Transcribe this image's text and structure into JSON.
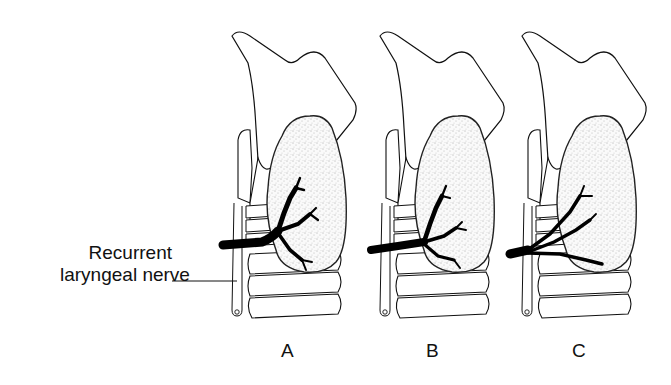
{
  "figure": {
    "annotation": {
      "line1": "Recurrent",
      "line2": "laryngeal nerve"
    },
    "panels": [
      {
        "label": "A",
        "variant": "nerve branches within lower gland"
      },
      {
        "label": "B",
        "variant": "nerve branches within gland, lower branching"
      },
      {
        "label": "C",
        "variant": "nerve branches diverge before entering gland"
      }
    ],
    "colors": {
      "ink": "#111111",
      "background": "#ffffff",
      "stipple": "#444444"
    }
  }
}
